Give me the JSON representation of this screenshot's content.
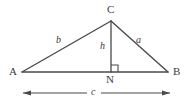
{
  "figure": {
    "stroke_color": "#4a4a4a",
    "text_color": "#3b3b3b",
    "background_color": "#ffffff",
    "vertices": [
      {
        "name": "A",
        "label": "A",
        "x": 22,
        "y": 72
      },
      {
        "name": "B",
        "label": "B",
        "x": 168,
        "y": 72
      },
      {
        "name": "C",
        "label": "C",
        "x": 111,
        "y": 21
      },
      {
        "name": "N",
        "label": "N",
        "x": 111,
        "y": 72
      }
    ],
    "segments": [
      {
        "name": "side-b",
        "label": "b",
        "from": "A",
        "to": "C"
      },
      {
        "name": "side-a",
        "label": "a",
        "from": "C",
        "to": "B"
      },
      {
        "name": "base-AB",
        "label": "",
        "from": "A",
        "to": "B"
      },
      {
        "name": "altitude-h",
        "label": "h",
        "from": "C",
        "to": "N"
      }
    ],
    "markers": {
      "right_angle": {
        "name": "right-angle-marker",
        "at": "N",
        "size": 6
      }
    },
    "dimension": {
      "name": "base-dimension-c",
      "label": "c",
      "x_start": 23,
      "x_end": 170,
      "y": 93
    }
  }
}
